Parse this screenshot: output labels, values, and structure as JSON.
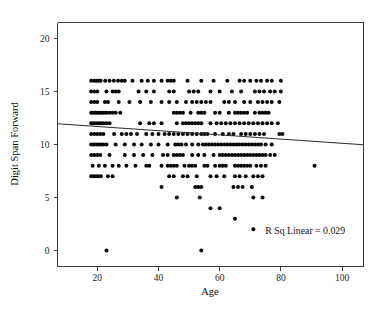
{
  "chart_data": {
    "type": "scatter",
    "title": "",
    "xlabel": "Age",
    "ylabel": "Digit Span Forward",
    "xlim": [
      7,
      107
    ],
    "ylim": [
      -1.5,
      21.5
    ],
    "xticks": [
      20,
      40,
      60,
      80,
      100
    ],
    "xtick_labels": [
      "20",
      "40",
      "60",
      "80",
      "100"
    ],
    "yticks": [
      0,
      5,
      10,
      15,
      20
    ],
    "ytick_labels": [
      "0",
      "5",
      "10",
      "15",
      "20"
    ],
    "grid": false,
    "legend": null,
    "annotations": [
      {
        "name": "r-squared-annotation",
        "text": "R Sq Linear = 0.029",
        "x": 101,
        "y": 1.6
      }
    ],
    "fit_line": {
      "name": "linear-fit-line",
      "r_squared": 0.029,
      "x_start": 7,
      "y_start": 11.95,
      "x_end": 107,
      "y_end": 9.98
    },
    "marker": {
      "shape": "circle",
      "size_px": 2.0,
      "color": "#080808"
    },
    "points": [
      [
        18,
        16
      ],
      [
        19,
        16
      ],
      [
        19.7,
        16
      ],
      [
        20.4,
        16
      ],
      [
        21.1,
        16
      ],
      [
        22.6,
        16
      ],
      [
        24,
        16
      ],
      [
        25.4,
        16
      ],
      [
        26.8,
        16
      ],
      [
        28,
        16
      ],
      [
        29,
        16
      ],
      [
        31.5,
        16
      ],
      [
        34.5,
        16
      ],
      [
        36.5,
        16
      ],
      [
        38.5,
        16
      ],
      [
        41,
        16
      ],
      [
        43,
        16
      ],
      [
        44,
        16
      ],
      [
        45,
        16
      ],
      [
        49.5,
        16
      ],
      [
        54,
        16
      ],
      [
        58,
        16
      ],
      [
        62.5,
        16
      ],
      [
        66.5,
        16
      ],
      [
        68,
        16
      ],
      [
        70,
        16
      ],
      [
        72,
        16
      ],
      [
        73.5,
        16
      ],
      [
        75.5,
        16
      ],
      [
        77,
        16
      ],
      [
        80,
        16
      ],
      [
        18,
        15
      ],
      [
        19,
        15
      ],
      [
        20,
        15
      ],
      [
        23,
        15
      ],
      [
        25,
        15
      ],
      [
        26,
        15
      ],
      [
        27,
        15
      ],
      [
        33.5,
        15
      ],
      [
        36,
        15
      ],
      [
        38.5,
        15
      ],
      [
        43.5,
        15
      ],
      [
        45,
        15
      ],
      [
        50,
        15
      ],
      [
        51.5,
        15
      ],
      [
        53,
        15
      ],
      [
        57,
        15
      ],
      [
        60,
        15
      ],
      [
        64,
        15
      ],
      [
        67,
        15
      ],
      [
        71.5,
        15
      ],
      [
        73,
        15
      ],
      [
        74.5,
        15
      ],
      [
        76.5,
        15
      ],
      [
        78,
        15
      ],
      [
        80,
        15
      ],
      [
        18,
        14
      ],
      [
        19,
        14
      ],
      [
        20,
        14
      ],
      [
        22.5,
        14
      ],
      [
        23.5,
        14
      ],
      [
        27,
        14
      ],
      [
        30.5,
        14
      ],
      [
        34,
        14
      ],
      [
        37.5,
        14
      ],
      [
        41,
        14
      ],
      [
        43.5,
        14
      ],
      [
        46,
        14
      ],
      [
        49,
        14
      ],
      [
        51,
        14
      ],
      [
        52.5,
        14
      ],
      [
        54,
        14
      ],
      [
        55.5,
        14
      ],
      [
        57,
        14
      ],
      [
        61.5,
        14
      ],
      [
        63,
        14
      ],
      [
        65,
        14
      ],
      [
        68,
        14
      ],
      [
        70,
        14
      ],
      [
        72.5,
        14
      ],
      [
        74,
        14
      ],
      [
        75.5,
        14
      ],
      [
        77,
        14
      ],
      [
        79.5,
        14
      ],
      [
        18,
        13
      ],
      [
        18.7,
        13
      ],
      [
        19.4,
        13
      ],
      [
        20.1,
        13
      ],
      [
        20.8,
        13
      ],
      [
        21.5,
        13
      ],
      [
        22.2,
        13
      ],
      [
        23,
        13
      ],
      [
        24,
        13
      ],
      [
        25,
        13
      ],
      [
        26,
        13
      ],
      [
        27.5,
        13
      ],
      [
        45,
        13
      ],
      [
        46,
        13
      ],
      [
        47,
        13
      ],
      [
        48,
        13
      ],
      [
        50.5,
        13
      ],
      [
        53,
        13
      ],
      [
        54,
        13
      ],
      [
        55,
        13
      ],
      [
        58.5,
        13
      ],
      [
        60,
        13
      ],
      [
        63,
        13
      ],
      [
        65,
        13
      ],
      [
        66,
        13
      ],
      [
        67,
        13
      ],
      [
        68,
        13
      ],
      [
        69,
        13
      ],
      [
        71.5,
        13
      ],
      [
        73,
        13
      ],
      [
        74,
        13
      ],
      [
        75,
        13
      ],
      [
        76,
        13
      ],
      [
        18,
        12
      ],
      [
        18.8,
        12
      ],
      [
        19.6,
        12
      ],
      [
        20.4,
        12
      ],
      [
        21.2,
        12
      ],
      [
        22,
        12
      ],
      [
        23,
        12
      ],
      [
        24,
        12
      ],
      [
        34,
        12
      ],
      [
        37,
        12
      ],
      [
        38.5,
        12
      ],
      [
        41,
        12
      ],
      [
        46,
        12
      ],
      [
        48,
        12
      ],
      [
        49,
        12
      ],
      [
        50,
        12
      ],
      [
        51,
        12
      ],
      [
        52,
        12
      ],
      [
        53,
        12
      ],
      [
        54,
        12
      ],
      [
        57,
        12
      ],
      [
        59,
        12
      ],
      [
        60.5,
        12
      ],
      [
        62,
        12
      ],
      [
        63.5,
        12
      ],
      [
        65,
        12
      ],
      [
        66.5,
        12
      ],
      [
        68,
        12
      ],
      [
        69.5,
        12
      ],
      [
        71,
        12
      ],
      [
        72.5,
        12
      ],
      [
        74,
        12
      ],
      [
        75.5,
        12
      ],
      [
        77,
        12
      ],
      [
        79,
        12
      ],
      [
        18,
        11
      ],
      [
        19,
        11
      ],
      [
        20,
        11
      ],
      [
        21,
        11
      ],
      [
        22,
        11
      ],
      [
        25.5,
        11
      ],
      [
        28,
        11
      ],
      [
        29.5,
        11
      ],
      [
        31,
        11
      ],
      [
        33,
        11
      ],
      [
        36,
        11
      ],
      [
        38,
        11
      ],
      [
        40,
        11
      ],
      [
        42,
        11
      ],
      [
        43.5,
        11
      ],
      [
        45,
        11
      ],
      [
        46.5,
        11
      ],
      [
        48,
        11
      ],
      [
        49.5,
        11
      ],
      [
        51,
        11
      ],
      [
        52.5,
        11
      ],
      [
        54,
        11
      ],
      [
        55,
        11
      ],
      [
        56,
        11
      ],
      [
        58.5,
        11
      ],
      [
        61,
        11
      ],
      [
        63,
        11
      ],
      [
        64.5,
        11
      ],
      [
        67,
        11
      ],
      [
        68.5,
        11
      ],
      [
        70,
        11
      ],
      [
        71.5,
        11
      ],
      [
        73,
        11
      ],
      [
        74.5,
        11
      ],
      [
        79.5,
        11
      ],
      [
        80.5,
        11
      ],
      [
        18,
        10
      ],
      [
        18.8,
        10
      ],
      [
        19.6,
        10
      ],
      [
        20.4,
        10
      ],
      [
        21.2,
        10
      ],
      [
        22,
        10
      ],
      [
        23,
        10
      ],
      [
        26,
        10
      ],
      [
        29,
        10
      ],
      [
        32,
        10
      ],
      [
        34.5,
        10
      ],
      [
        37.5,
        10
      ],
      [
        40,
        10
      ],
      [
        43,
        10
      ],
      [
        45.5,
        10
      ],
      [
        46.5,
        10
      ],
      [
        47.5,
        10
      ],
      [
        49,
        10
      ],
      [
        51,
        10
      ],
      [
        53,
        10
      ],
      [
        54.5,
        10
      ],
      [
        55.5,
        10
      ],
      [
        56.5,
        10
      ],
      [
        57.5,
        10
      ],
      [
        58.5,
        10
      ],
      [
        59.5,
        10
      ],
      [
        60.5,
        10
      ],
      [
        61.5,
        10
      ],
      [
        62.5,
        10
      ],
      [
        63.5,
        10
      ],
      [
        64.5,
        10
      ],
      [
        65.5,
        10
      ],
      [
        66.5,
        10
      ],
      [
        67.5,
        10
      ],
      [
        68.5,
        10
      ],
      [
        69.5,
        10
      ],
      [
        70.5,
        10
      ],
      [
        71.5,
        10
      ],
      [
        72.5,
        10
      ],
      [
        73.5,
        10
      ],
      [
        75,
        10
      ],
      [
        77,
        10
      ],
      [
        18,
        9
      ],
      [
        19,
        9
      ],
      [
        20,
        9
      ],
      [
        21,
        9
      ],
      [
        24,
        9
      ],
      [
        29,
        9
      ],
      [
        32,
        9
      ],
      [
        35,
        9
      ],
      [
        38,
        9
      ],
      [
        41.5,
        9
      ],
      [
        43,
        9
      ],
      [
        45,
        9
      ],
      [
        46,
        9
      ],
      [
        47,
        9
      ],
      [
        48,
        9
      ],
      [
        51,
        9
      ],
      [
        53,
        9
      ],
      [
        55,
        9
      ],
      [
        58,
        9
      ],
      [
        60,
        9
      ],
      [
        61,
        9
      ],
      [
        62,
        9
      ],
      [
        63,
        9
      ],
      [
        64,
        9
      ],
      [
        65,
        9
      ],
      [
        66,
        9
      ],
      [
        67,
        9
      ],
      [
        68,
        9
      ],
      [
        69,
        9
      ],
      [
        70,
        9
      ],
      [
        71,
        9
      ],
      [
        72,
        9
      ],
      [
        73,
        9
      ],
      [
        74,
        9
      ],
      [
        75,
        9
      ],
      [
        76.5,
        9
      ],
      [
        78,
        9
      ],
      [
        18.5,
        8
      ],
      [
        20.5,
        8
      ],
      [
        22.5,
        8
      ],
      [
        25,
        8
      ],
      [
        27,
        8
      ],
      [
        29.5,
        8
      ],
      [
        32.5,
        8
      ],
      [
        36,
        8
      ],
      [
        37,
        8
      ],
      [
        41,
        8
      ],
      [
        43,
        8
      ],
      [
        44,
        8
      ],
      [
        45,
        8
      ],
      [
        46,
        8
      ],
      [
        48.5,
        8
      ],
      [
        50,
        8
      ],
      [
        51,
        8
      ],
      [
        52,
        8
      ],
      [
        55,
        8
      ],
      [
        56,
        8
      ],
      [
        58.5,
        8
      ],
      [
        60,
        8
      ],
      [
        61,
        8
      ],
      [
        62,
        8
      ],
      [
        65,
        8
      ],
      [
        66,
        8
      ],
      [
        67,
        8
      ],
      [
        68,
        8
      ],
      [
        69,
        8
      ],
      [
        70,
        8
      ],
      [
        72,
        8
      ],
      [
        73.5,
        8
      ],
      [
        75,
        8
      ],
      [
        91,
        8
      ],
      [
        18,
        7
      ],
      [
        18.8,
        7
      ],
      [
        19.6,
        7
      ],
      [
        20.4,
        7
      ],
      [
        21.2,
        7
      ],
      [
        23.5,
        7
      ],
      [
        25,
        7
      ],
      [
        43.5,
        7
      ],
      [
        45,
        7
      ],
      [
        48,
        7
      ],
      [
        49.5,
        7
      ],
      [
        52.5,
        7
      ],
      [
        57,
        7
      ],
      [
        59,
        7
      ],
      [
        61.5,
        7
      ],
      [
        65,
        7
      ],
      [
        66.5,
        7
      ],
      [
        68.5,
        7
      ],
      [
        71,
        7
      ],
      [
        72.5,
        7
      ],
      [
        74,
        7
      ],
      [
        41,
        6
      ],
      [
        52,
        6
      ],
      [
        53,
        6
      ],
      [
        54,
        6
      ],
      [
        64.5,
        6
      ],
      [
        66,
        6
      ],
      [
        67.5,
        6
      ],
      [
        70.5,
        6
      ],
      [
        46,
        5
      ],
      [
        53.5,
        5
      ],
      [
        71,
        5
      ],
      [
        74,
        5
      ],
      [
        57,
        4
      ],
      [
        60,
        4
      ],
      [
        65,
        3
      ],
      [
        71,
        2
      ],
      [
        23,
        0
      ],
      [
        54,
        0
      ]
    ]
  }
}
